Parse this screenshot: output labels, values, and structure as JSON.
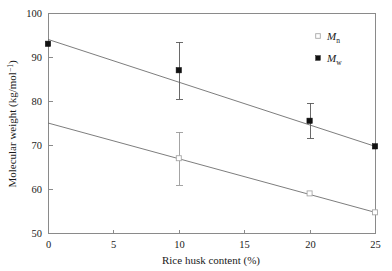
{
  "chart_data": {
    "type": "scatter",
    "title": "",
    "subtitle": "",
    "xlabel": "Rice husk content (%)",
    "ylabel": "Molecular weight (kg/mol",
    "ylabel_superscript": "−1",
    "ylabel_suffix": ")",
    "xlim": [
      0,
      25
    ],
    "ylim": [
      50,
      100
    ],
    "xticks": [
      0,
      5,
      10,
      15,
      20,
      25
    ],
    "yticks": [
      50,
      60,
      70,
      80,
      90,
      100
    ],
    "xtick_labels": [
      "0",
      "5",
      "10",
      "15",
      "20",
      "25"
    ],
    "ytick_labels": [
      "50",
      "60",
      "70",
      "80",
      "90",
      "100"
    ],
    "grid": false,
    "legend_position": "top-right",
    "frame": true,
    "series": [
      {
        "name": "Mn",
        "label_base": "M",
        "label_sub": "n",
        "marker": "open-square",
        "x": [
          10,
          20,
          25
        ],
        "values": [
          67.0,
          59.0,
          54.7
        ],
        "yerr": [
          6.0,
          0.0,
          0.0
        ],
        "trend": {
          "x": [
            0,
            25
          ],
          "y": [
            75.0,
            54.7
          ]
        }
      },
      {
        "name": "Mw",
        "label_base": "M",
        "label_sub": "w",
        "marker": "filled-square",
        "x": [
          0,
          10,
          20,
          25
        ],
        "values": [
          93.0,
          87.0,
          75.5,
          69.7
        ],
        "yerr": [
          0.0,
          6.5,
          4.0,
          0.0
        ],
        "trend": {
          "x": [
            0,
            25
          ],
          "y": [
            94.0,
            69.7
          ]
        }
      }
    ]
  },
  "legend": {
    "items": [
      {
        "base": "M",
        "sub": "n",
        "marker": "open-square"
      },
      {
        "base": "M",
        "sub": "w",
        "marker": "filled-square"
      }
    ]
  },
  "colors": {
    "background": "#ffffff",
    "axis": "#8a8a8a",
    "trend_line": "#6e6e6e",
    "marker_filled": "#111111",
    "marker_open_stroke": "#a8a8a8",
    "errorbar_light": "#9a9a9a",
    "errorbar_dark": "#5a5a5a",
    "text": "#1a1a1a"
  }
}
